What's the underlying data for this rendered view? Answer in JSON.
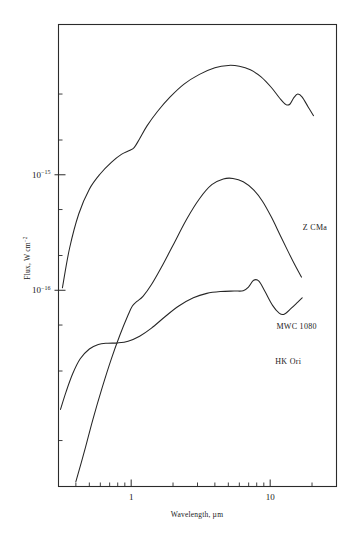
{
  "chart_data": {
    "type": "line",
    "title": "",
    "xlabel": "Wavelength, µm",
    "ylabel": "Flux, W cm",
    "ylabel_exponent": "−2",
    "xscale": "log",
    "yscale": "log",
    "xlim": [
      0.3,
      30
    ],
    "ylim": [
      2e-18,
      2e-14
    ],
    "grid": false,
    "legend_position": "inline-right",
    "xticks_major": [
      {
        "value": 1,
        "label": "1"
      },
      {
        "value": 10,
        "label": "10"
      }
    ],
    "xticks_minor": [
      0.4,
      0.5,
      0.6,
      0.7,
      0.8,
      0.9,
      2,
      3,
      4,
      5,
      6,
      7,
      8,
      9,
      20,
      30
    ],
    "yticks_major": [
      {
        "value": 1e-15,
        "mantissa": "10",
        "exponent": "−15"
      },
      {
        "value": 1e-16,
        "mantissa": "10",
        "exponent": "−16"
      }
    ],
    "yticks_minor": [
      2e-18,
      5e-18,
      2e-17,
      5e-17,
      2e-16,
      5e-16,
      2e-15,
      5e-15
    ],
    "series": [
      {
        "name": "Z CMa",
        "label": "Z CMa",
        "label_x": 21.0,
        "label_y": 3.3e-16,
        "points": [
          [
            0.32,
            1.05e-16
          ],
          [
            0.36,
            2.3e-16
          ],
          [
            0.42,
            4.6e-16
          ],
          [
            0.5,
            7.5e-16
          ],
          [
            0.6,
            1.02e-15
          ],
          [
            0.72,
            1.28e-15
          ],
          [
            0.85,
            1.5e-15
          ],
          [
            0.97,
            1.62e-15
          ],
          [
            1.05,
            1.72e-15
          ],
          [
            1.15,
            2.05e-15
          ],
          [
            1.3,
            2.65e-15
          ],
          [
            1.55,
            3.55e-15
          ],
          [
            1.9,
            4.7e-15
          ],
          [
            2.4,
            6.1e-15
          ],
          [
            3.1,
            7.4e-15
          ],
          [
            4.0,
            8.45e-15
          ],
          [
            5.0,
            8.85e-15
          ],
          [
            6.0,
            8.7e-15
          ],
          [
            7.2,
            8.1e-15
          ],
          [
            8.6,
            7.05e-15
          ],
          [
            10.2,
            5.7e-15
          ],
          [
            11.8,
            4.55e-15
          ],
          [
            13.0,
            4.05e-15
          ],
          [
            13.9,
            4.1e-15
          ],
          [
            14.8,
            4.65e-15
          ],
          [
            15.8,
            5e-15
          ],
          [
            17.0,
            4.7e-15
          ],
          [
            18.8,
            3.85e-15
          ],
          [
            20.5,
            3.25e-15
          ]
        ]
      },
      {
        "name": "MWC 1080",
        "label": "MWC 1080",
        "label_x": 15.5,
        "label_y": 4.6e-17,
        "points": [
          [
            0.4,
            2.2e-18
          ],
          [
            0.46,
            4e-18
          ],
          [
            0.53,
            7.6e-18
          ],
          [
            0.62,
            1.45e-17
          ],
          [
            0.72,
            2.55e-17
          ],
          [
            0.83,
            4.1e-17
          ],
          [
            0.95,
            6.1e-17
          ],
          [
            1.02,
            7.3e-17
          ],
          [
            1.1,
            8e-17
          ],
          [
            1.22,
            8.9e-17
          ],
          [
            1.4,
            1.12e-16
          ],
          [
            1.65,
            1.58e-16
          ],
          [
            2.0,
            2.45e-16
          ],
          [
            2.5,
            4.1e-16
          ],
          [
            3.1,
            6.2e-16
          ],
          [
            3.8,
            8.2e-16
          ],
          [
            4.6,
            9.2e-16
          ],
          [
            5.4,
            9.3e-16
          ],
          [
            6.4,
            8.7e-16
          ],
          [
            7.6,
            7.4e-16
          ],
          [
            8.8,
            5.9e-16
          ],
          [
            10.2,
            4.3e-16
          ],
          [
            11.8,
            3e-16
          ],
          [
            13.5,
            2.15e-16
          ],
          [
            15.2,
            1.62e-16
          ],
          [
            16.8,
            1.3e-16
          ]
        ]
      },
      {
        "name": "HK Ori",
        "label": "HK Ori",
        "label_x": 13.5,
        "label_y": 2.3e-17,
        "points": [
          [
            0.31,
            9.3e-18
          ],
          [
            0.34,
            1.32e-17
          ],
          [
            0.38,
            1.9e-17
          ],
          [
            0.43,
            2.55e-17
          ],
          [
            0.5,
            3.1e-17
          ],
          [
            0.58,
            3.4e-17
          ],
          [
            0.68,
            3.48e-17
          ],
          [
            0.8,
            3.5e-17
          ],
          [
            0.95,
            3.62e-17
          ],
          [
            1.15,
            4e-17
          ],
          [
            1.4,
            4.7e-17
          ],
          [
            1.75,
            5.9e-17
          ],
          [
            2.2,
            7.3e-17
          ],
          [
            2.8,
            8.6e-17
          ],
          [
            3.5,
            9.4e-17
          ],
          [
            4.4,
            9.75e-17
          ],
          [
            5.5,
            9.85e-17
          ],
          [
            6.4,
            9.9e-17
          ],
          [
            7.0,
            1.07e-16
          ],
          [
            7.6,
            1.22e-16
          ],
          [
            8.3,
            1.2e-16
          ],
          [
            9.2,
            9.7e-17
          ],
          [
            10.4,
            7.4e-17
          ],
          [
            11.6,
            6.35e-17
          ],
          [
            12.6,
            6.2e-17
          ],
          [
            14.2,
            7e-17
          ],
          [
            15.8,
            7.9e-17
          ],
          [
            17.0,
            8.6e-17
          ]
        ]
      }
    ]
  }
}
